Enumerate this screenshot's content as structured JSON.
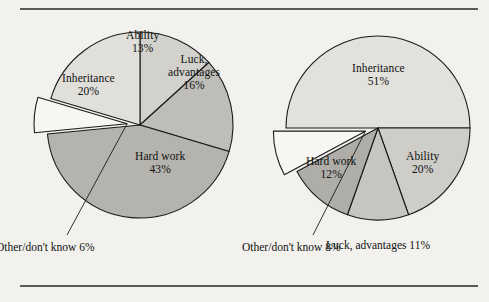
{
  "figure": {
    "background_color": "#f2f1ee",
    "rule_color": "#5a5a5a",
    "outline_color": "#1a1a1a"
  },
  "chart_data": [
    {
      "type": "pie",
      "title": "",
      "name": "left-pie",
      "center": [
        140,
        125
      ],
      "radius": 93,
      "start_angle_deg": -90,
      "direction": "clockwise",
      "categories": [
        "Ability",
        "Luck, advantages",
        "Hard work",
        "Other/don't know",
        "Inheritance"
      ],
      "values": [
        13,
        16,
        43,
        6,
        20
      ],
      "slices": [
        {
          "label": "Ability",
          "value": 13,
          "value_label": "13%",
          "color": "#d2d1cc",
          "exploded": false,
          "label_pos": [
            142,
            42
          ]
        },
        {
          "label": "Luck,\nadvantages",
          "label_line1": "Luck,",
          "label_line2": "advantages",
          "value": 16,
          "value_label": "16%",
          "color": "#bebdb8",
          "exploded": false,
          "label_pos": [
            194,
            72
          ]
        },
        {
          "label": "Hard work",
          "value": 43,
          "value_label": "43%",
          "color": "#b4b3ae",
          "exploded": false,
          "label_pos": [
            160,
            163
          ]
        },
        {
          "label": "Other/don't know",
          "label_line1": "Other/don't",
          "label_line2": "know",
          "value": 6,
          "value_label": "6%",
          "color": "#f7f6f3",
          "exploded": true,
          "callout_pos": [
            45,
            247
          ]
        },
        {
          "label": "Inheritance",
          "value": 20,
          "value_label": "20%",
          "color": "#e0dfda",
          "exploded": false,
          "label_pos": [
            88,
            85
          ]
        }
      ],
      "legend": "none",
      "grid": false
    },
    {
      "type": "pie",
      "title": "",
      "name": "right-pie",
      "center": [
        378,
        128
      ],
      "radius": 92,
      "start_angle_deg": 180,
      "direction": "clockwise",
      "categories": [
        "Inheritance",
        "Ability",
        "Luck, advantages",
        "Hard work",
        "Other/don't know"
      ],
      "values": [
        51,
        20,
        11,
        12,
        8
      ],
      "slices": [
        {
          "label": "Inheritance",
          "value": 51,
          "value_label": "51%",
          "color": "#e2e1dc",
          "exploded": false,
          "label_pos": [
            378,
            75
          ]
        },
        {
          "label": "Ability",
          "value": 20,
          "value_label": "20%",
          "color": "#cecdc8",
          "exploded": false,
          "label_pos": [
            422,
            163
          ]
        },
        {
          "label": "Luck, advantages",
          "label_line1": "Luck,",
          "label_line2": "advantages",
          "value": 11,
          "value_label": "11%",
          "color": "#c6c5c0",
          "exploded": false,
          "callout_pos": [
            378,
            245
          ]
        },
        {
          "label": "Hard work",
          "value": 12,
          "value_label": "12%",
          "color": "#aeada8",
          "exploded": false,
          "label_pos": [
            331,
            168
          ]
        },
        {
          "label": "Other/don't know",
          "label_line1": "Other/don't",
          "label_line2": "know",
          "value": 8,
          "value_label": "8%",
          "color": "#f7f6f3",
          "exploded": true,
          "callout_pos": [
            291,
            247
          ]
        }
      ],
      "legend": "none",
      "grid": false
    }
  ]
}
